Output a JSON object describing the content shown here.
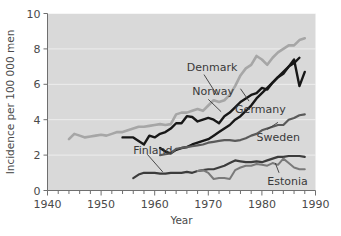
{
  "chart_data": {
    "type": "line",
    "title": "",
    "xlabel": "Year",
    "ylabel": "Incidence per 100 000 men",
    "xlim": [
      1940,
      1990
    ],
    "ylim": [
      0,
      10
    ],
    "xticks": [
      1940,
      1950,
      1960,
      1970,
      1980,
      1990
    ],
    "xtick_labels": [
      "1940",
      "1950",
      "1960",
      "1970",
      "1980",
      "1990"
    ],
    "xminor_step": 2,
    "yticks": [
      0,
      2,
      4,
      6,
      8,
      10
    ],
    "ytick_labels": [
      "0",
      "2",
      "4",
      "6",
      "8",
      "10"
    ],
    "grid": "horizontal-white",
    "plot_background": "#d9d9d9",
    "legend": "inline-annotations",
    "series": [
      {
        "name": "Denmark",
        "color": "#a6a6a6",
        "width": 2.6,
        "label_x": 1966,
        "label_y": 7.0,
        "x": [
          1944,
          1945,
          1946,
          1947,
          1948,
          1949,
          1950,
          1951,
          1952,
          1953,
          1954,
          1955,
          1956,
          1957,
          1958,
          1959,
          1960,
          1961,
          1962,
          1963,
          1964,
          1965,
          1966,
          1967,
          1968,
          1969,
          1970,
          1971,
          1972,
          1973,
          1974,
          1975,
          1976,
          1977,
          1978,
          1979,
          1980,
          1981,
          1982,
          1983,
          1984,
          1985,
          1986,
          1987,
          1988
        ],
        "y": [
          2.9,
          3.2,
          3.1,
          3.0,
          3.05,
          3.1,
          3.15,
          3.1,
          3.2,
          3.3,
          3.3,
          3.4,
          3.5,
          3.6,
          3.6,
          3.65,
          3.7,
          3.75,
          3.7,
          3.75,
          4.3,
          4.4,
          4.4,
          4.5,
          4.6,
          4.5,
          4.8,
          5.1,
          5.0,
          5.1,
          5.4,
          5.9,
          6.5,
          6.9,
          7.1,
          7.6,
          7.4,
          7.1,
          7.5,
          7.8,
          8.0,
          8.2,
          8.2,
          8.5,
          8.6
        ]
      },
      {
        "name": "Norway",
        "color": "#171717",
        "width": 2.4,
        "label_x": 1967,
        "label_y": 5.6,
        "x": [
          1954,
          1955,
          1956,
          1957,
          1958,
          1959,
          1960,
          1961,
          1962,
          1963,
          1964,
          1965,
          1966,
          1967,
          1968,
          1969,
          1970,
          1971,
          1972,
          1973,
          1974,
          1975,
          1976,
          1977,
          1978,
          1979,
          1980,
          1981,
          1982,
          1983,
          1984,
          1985,
          1986,
          1987
        ],
        "y": [
          3.0,
          3.0,
          3.0,
          2.8,
          2.6,
          3.1,
          3.0,
          3.2,
          3.3,
          3.5,
          3.8,
          3.8,
          4.2,
          4.15,
          3.9,
          4.0,
          4.1,
          4.0,
          3.8,
          4.2,
          4.4,
          4.7,
          5.0,
          5.2,
          5.4,
          5.5,
          5.8,
          5.7,
          6.1,
          6.4,
          6.7,
          7.0,
          7.2,
          7.5
        ]
      },
      {
        "name": "Germany",
        "color": "#171717",
        "width": 2.4,
        "label_x": 1975,
        "label_y": 4.6,
        "x": [
          1961,
          1962,
          1963,
          1964,
          1965,
          1966,
          1967,
          1968,
          1969,
          1970,
          1971,
          1972,
          1973,
          1974,
          1975,
          1976,
          1977,
          1978,
          1979,
          1980,
          1981,
          1982,
          1983,
          1984,
          1985,
          1986,
          1987,
          1988
        ],
        "y": [
          2.4,
          2.2,
          2.1,
          2.3,
          2.4,
          2.45,
          2.6,
          2.7,
          2.8,
          2.9,
          3.1,
          3.3,
          3.5,
          3.7,
          4.0,
          4.2,
          4.5,
          4.8,
          5.2,
          5.5,
          5.8,
          6.1,
          6.4,
          6.6,
          7.0,
          7.4,
          5.9,
          6.7
        ]
      },
      {
        "name": "Sweden",
        "color": "#5a5a5a",
        "width": 2.2,
        "label_x": 1979,
        "label_y": 3.0,
        "x": [
          1961,
          1962,
          1963,
          1964,
          1965,
          1966,
          1967,
          1968,
          1969,
          1970,
          1971,
          1972,
          1973,
          1974,
          1975,
          1976,
          1977,
          1978,
          1979,
          1980,
          1981,
          1982,
          1983,
          1984,
          1985,
          1986,
          1987,
          1988
        ],
        "y": [
          2.0,
          2.05,
          2.1,
          2.35,
          2.4,
          2.45,
          2.5,
          2.55,
          2.6,
          2.7,
          2.75,
          2.8,
          2.85,
          2.85,
          2.8,
          2.85,
          2.95,
          3.1,
          3.2,
          3.4,
          3.5,
          3.6,
          3.7,
          3.7,
          4.0,
          4.1,
          4.25,
          4.3
        ]
      },
      {
        "name": "Finland",
        "color": "#3c3c3c",
        "width": 2.2,
        "label_x": 1956,
        "label_y": 2.3,
        "x": [
          1956,
          1957,
          1958,
          1959,
          1960,
          1961,
          1962,
          1963,
          1964,
          1965,
          1966,
          1967,
          1968,
          1969,
          1970,
          1971,
          1972,
          1973,
          1974,
          1975,
          1976,
          1977,
          1978,
          1979,
          1980,
          1981,
          1982,
          1983,
          1984,
          1985,
          1986,
          1987,
          1988
        ],
        "y": [
          0.7,
          0.9,
          1.0,
          1.0,
          1.0,
          0.95,
          0.95,
          1.0,
          1.0,
          1.0,
          1.05,
          1.0,
          1.1,
          1.15,
          1.2,
          1.2,
          1.3,
          1.4,
          1.55,
          1.7,
          1.65,
          1.6,
          1.6,
          1.65,
          1.6,
          1.7,
          1.8,
          1.9,
          1.9,
          1.95,
          1.95,
          1.95,
          1.9
        ]
      },
      {
        "name": "Estonia",
        "color": "#7a7a7a",
        "width": 2.0,
        "label_x": 1981,
        "label_y": 0.55,
        "x": [
          1968,
          1969,
          1970,
          1971,
          1972,
          1973,
          1974,
          1975,
          1976,
          1977,
          1978,
          1979,
          1980,
          1981,
          1982,
          1983,
          1984,
          1985,
          1986,
          1987,
          1988
        ],
        "y": [
          1.1,
          1.15,
          1.0,
          0.65,
          0.7,
          0.7,
          0.65,
          1.15,
          1.3,
          1.4,
          1.4,
          1.5,
          1.45,
          1.4,
          1.55,
          1.45,
          1.8,
          1.55,
          1.3,
          1.2,
          1.2
        ]
      }
    ],
    "annotations": [
      {
        "label": "Denmark",
        "leader_from": [
          1969.2,
          6.55
        ],
        "leader_to": [
          1971.6,
          5.4
        ]
      },
      {
        "label": "Norway",
        "leader_from": [
          1970.0,
          5.15
        ],
        "leader_to": [
          1972.4,
          4.45
        ]
      },
      {
        "label": "Germany",
        "leader_from": [
          1977.6,
          5.05
        ],
        "leader_to": [
          1976.0,
          5.75
        ]
      },
      {
        "label": "Sweden",
        "leader_from": [
          1981.0,
          3.45
        ],
        "leader_to": [
          1983.0,
          3.85
        ]
      },
      {
        "label": "Finland",
        "leader_from": [
          1958.6,
          2.05
        ],
        "leader_to": [
          1961.5,
          1.05
        ]
      },
      {
        "label": "Estonia",
        "leader_from": [
          1983.2,
          1.0
        ],
        "leader_to": [
          1982.5,
          1.55
        ]
      }
    ]
  }
}
